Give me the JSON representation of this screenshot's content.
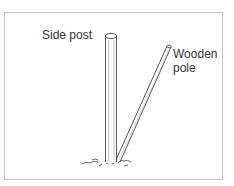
{
  "labels": {
    "side_post": "Side post",
    "wooden_pole_line1": "Wooden",
    "wooden_pole_line2": "pole"
  },
  "colors": {
    "stroke": "#444444",
    "border": "#c8c8c8"
  }
}
